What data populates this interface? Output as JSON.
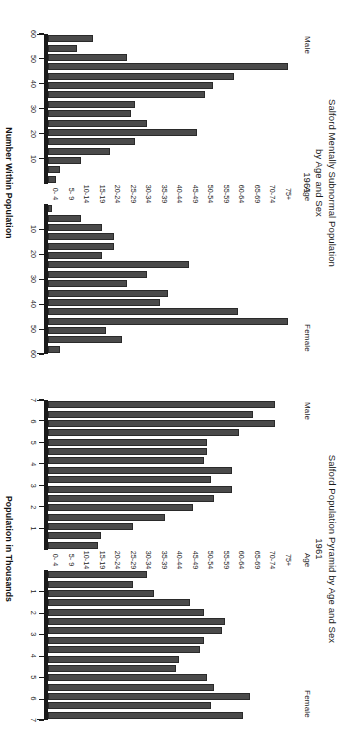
{
  "figure": {
    "age_header": "Age",
    "male_label": "Male",
    "female_label": "Female",
    "bar_color": "#4a4a4a",
    "bar_edge_color": "#2a2a2a",
    "background": "#ffffff"
  },
  "age_groups": [
    "75+",
    "70-74",
    "65-69",
    "60-64",
    "55-59",
    "50-54",
    "45-49",
    "40-44",
    "35-39",
    "30-34",
    "25-29",
    "20-24",
    "15-19",
    "10-14",
    "5- 9",
    "0- 4"
  ],
  "panels": [
    {
      "id": "mentally-subnormal",
      "title_lines": [
        "Salford Mentally Subnormal Population",
        "by Age and Sex",
        "1961"
      ],
      "axis_title": "Number Within Population",
      "tick_labels": [
        "10",
        "20",
        "30",
        "40",
        "50",
        "60"
      ]
    },
    {
      "id": "population-pyramid",
      "title_lines": [
        "Salford Population Pyramid by Age and Sex",
        "1961"
      ],
      "axis_title": "Population in Thousands",
      "tick_labels": [
        "1",
        "2",
        "3",
        "4",
        "5",
        "6",
        "7"
      ]
    }
  ],
  "chart_data": [
    {
      "type": "bar",
      "id": "mentally-subnormal",
      "title": "Salford Mentally Subnormal Population by Age and Sex 1961",
      "subtitle": "1961",
      "xlabel": "Number Within Population",
      "ylabel": "Age",
      "orientation": "horizontal-pyramid",
      "categories": [
        "75+",
        "70-74",
        "65-69",
        "60-64",
        "55-59",
        "50-54",
        "45-49",
        "40-44",
        "35-39",
        "30-34",
        "25-29",
        "20-24",
        "15-19",
        "10-14",
        "5- 9",
        "0- 4"
      ],
      "xlim": [
        0,
        60
      ],
      "xticks": [
        10,
        20,
        30,
        40,
        50,
        60
      ],
      "grid": false,
      "legend": [
        "Male",
        "Female"
      ],
      "legend_position": "panel-sides",
      "series": [
        {
          "name": "Male",
          "values": [
            2,
            3,
            8,
            15,
            21,
            36,
            24,
            20,
            21,
            38,
            40,
            45,
            58,
            19,
            7,
            11
          ]
        },
        {
          "name": "Female",
          "values": [
            1,
            8,
            13,
            16,
            16,
            13,
            34,
            24,
            19,
            29,
            27,
            46,
            58,
            14,
            18,
            3
          ]
        }
      ]
    },
    {
      "type": "bar",
      "id": "population-pyramid",
      "title": "Salford Population Pyramid by Age and Sex 1961",
      "subtitle": "1961",
      "xlabel": "Population in Thousands",
      "ylabel": "Age",
      "orientation": "horizontal-pyramid",
      "categories": [
        "75+",
        "70-74",
        "65-69",
        "60-64",
        "55-59",
        "50-54",
        "45-49",
        "40-44",
        "35-39",
        "30-34",
        "25-29",
        "20-24",
        "15-19",
        "10-14",
        "5- 9",
        "0- 4"
      ],
      "xlim": [
        0,
        7
      ],
      "xticks": [
        1,
        2,
        3,
        4,
        5,
        6,
        7
      ],
      "grid": false,
      "legend": [
        "Male",
        "Female"
      ],
      "legend_position": "panel-sides",
      "series": [
        {
          "name": "Male",
          "values": [
            1.4,
            1.5,
            2.4,
            3.3,
            4.1,
            4.7,
            5.2,
            4.6,
            5.2,
            4.4,
            4.5,
            4.5,
            5.4,
            6.4,
            5.8,
            6.4
          ]
        },
        {
          "name": "Female",
          "values": [
            2.8,
            2.4,
            3.0,
            4.0,
            4.4,
            5.0,
            4.9,
            4.4,
            4.3,
            3.7,
            3.6,
            4.5,
            4.7,
            5.7,
            4.6,
            5.5
          ]
        }
      ]
    }
  ]
}
